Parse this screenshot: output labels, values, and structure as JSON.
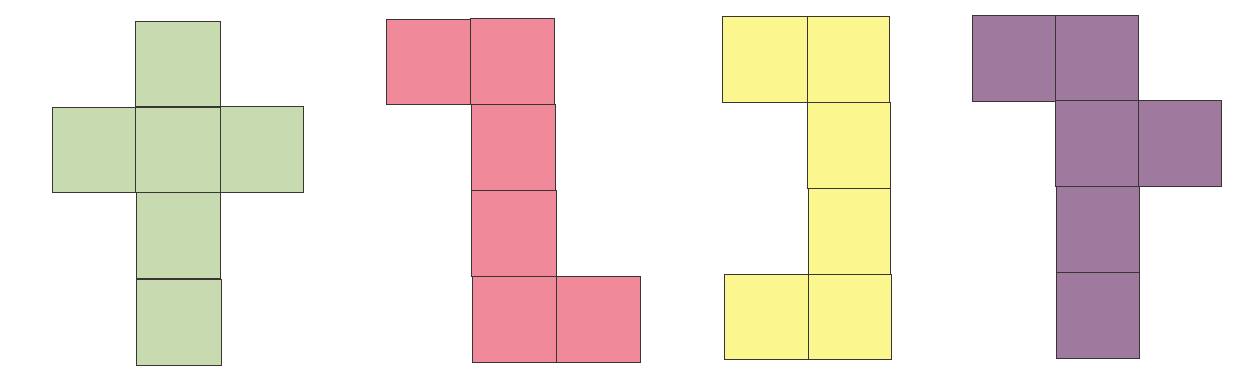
{
  "figure": {
    "nets": [
      {
        "name": "net-cross",
        "color": "#c8dbb0",
        "cells": [
          {
            "x": 135,
            "y": 21,
            "w": 86,
            "h": 86
          },
          {
            "x": 52,
            "y": 107,
            "w": 84,
            "h": 86
          },
          {
            "x": 135,
            "y": 107,
            "w": 86,
            "h": 86
          },
          {
            "x": 220,
            "y": 106,
            "w": 84,
            "h": 87
          },
          {
            "x": 136,
            "y": 192,
            "w": 85,
            "h": 87
          },
          {
            "x": 136,
            "y": 279,
            "w": 86,
            "h": 87
          }
        ]
      },
      {
        "name": "net-z",
        "color": "#f08a9a",
        "cells": [
          {
            "x": 386,
            "y": 19,
            "w": 85,
            "h": 86
          },
          {
            "x": 470,
            "y": 18,
            "w": 85,
            "h": 87
          },
          {
            "x": 471,
            "y": 104,
            "w": 85,
            "h": 87
          },
          {
            "x": 471,
            "y": 190,
            "w": 86,
            "h": 87
          },
          {
            "x": 472,
            "y": 276,
            "w": 85,
            "h": 87
          },
          {
            "x": 556,
            "y": 276,
            "w": 85,
            "h": 87
          }
        ]
      },
      {
        "name": "net-c",
        "color": "#fbf68e",
        "cells": [
          {
            "x": 722,
            "y": 16,
            "w": 86,
            "h": 87
          },
          {
            "x": 807,
            "y": 16,
            "w": 83,
            "h": 87
          },
          {
            "x": 807,
            "y": 102,
            "w": 84,
            "h": 87
          },
          {
            "x": 808,
            "y": 188,
            "w": 83,
            "h": 87
          },
          {
            "x": 724,
            "y": 274,
            "w": 85,
            "h": 86
          },
          {
            "x": 808,
            "y": 274,
            "w": 84,
            "h": 86
          }
        ]
      },
      {
        "name": "net-t",
        "color": "#a07a9e",
        "cells": [
          {
            "x": 972,
            "y": 15,
            "w": 84,
            "h": 87
          },
          {
            "x": 1055,
            "y": 15,
            "w": 84,
            "h": 87
          },
          {
            "x": 1055,
            "y": 100,
            "w": 84,
            "h": 87
          },
          {
            "x": 1138,
            "y": 100,
            "w": 84,
            "h": 87
          },
          {
            "x": 1056,
            "y": 186,
            "w": 84,
            "h": 87
          },
          {
            "x": 1056,
            "y": 272,
            "w": 84,
            "h": 87
          }
        ]
      }
    ]
  }
}
